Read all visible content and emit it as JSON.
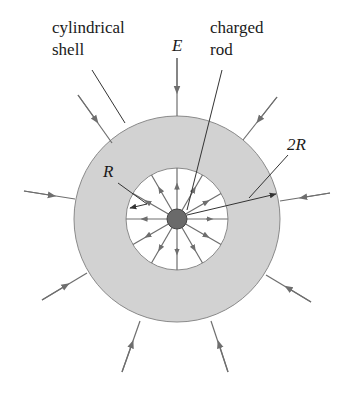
{
  "labels": {
    "shell_line1": "cylindrical",
    "shell_line2": "shell",
    "field": "E",
    "rod_line1": "charged",
    "rod_line2": "rod",
    "inner_radius": "R",
    "outer_radius": "2R"
  },
  "colors": {
    "shell_fill": "#d2d2d2",
    "shell_stroke": "#8a8a8a",
    "field_line": "#6e6e6e",
    "rod_fill": "#6a6a6a",
    "text": "#1a1a1a"
  },
  "geometry": {
    "center": [
      177,
      219
    ],
    "outer_radius": 103,
    "inner_radius": 51,
    "rod_radius": 10
  }
}
